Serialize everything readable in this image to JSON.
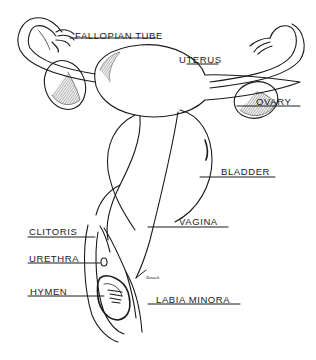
{
  "diagram": {
    "type": "anatomical-line-drawing",
    "colors": {
      "ink": "#1a1a1a",
      "background": "#ffffff"
    },
    "labels": [
      {
        "id": "fallopian-tube",
        "text": "FALLOPIAN TUBE"
      },
      {
        "id": "uterus",
        "text": "UTERUS"
      },
      {
        "id": "ovary",
        "text": "OVARY"
      },
      {
        "id": "bladder",
        "text": "BLADDER"
      },
      {
        "id": "vagina",
        "text": "VAGINA"
      },
      {
        "id": "clitoris",
        "text": "CLITORIS"
      },
      {
        "id": "urethra",
        "text": "URETHRA"
      },
      {
        "id": "hymen",
        "text": "HYMEN"
      },
      {
        "id": "labia-minora",
        "text": "LABIA MINORA"
      }
    ],
    "signature": "Renuck"
  }
}
